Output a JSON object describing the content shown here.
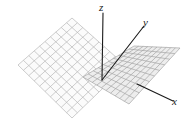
{
  "figure": {
    "name": "two-intersecting-planes-3d-axes",
    "background_color": "#ffffff",
    "axes": [
      {
        "id": "z",
        "label": "z",
        "icon": "axis-arrow-icon",
        "direction": "vertical-up",
        "from": [
          102,
          80
        ],
        "to": [
          103,
          13
        ],
        "color": "#1a1a1a"
      },
      {
        "id": "y",
        "label": "y",
        "icon": "axis-arrow-icon",
        "direction": "upper-right",
        "from": [
          102,
          80
        ],
        "to": [
          144,
          26
        ],
        "color": "#1a1a1a"
      },
      {
        "id": "x",
        "label": "x",
        "icon": "axis-arrow-icon",
        "direction": "lower-right",
        "from": [
          137,
          84
        ],
        "to": [
          173,
          101
        ],
        "color": "#1a1a1a"
      }
    ],
    "planes": [
      {
        "id": "left-plane",
        "name": "left-grid-plane",
        "fill_color": "#fbfbfb",
        "grid_line_color": "#b8b8b8",
        "grid_cols": 10,
        "grid_rows": 10,
        "corners": [
          [
            18,
            65
          ],
          [
            72,
            18
          ],
          [
            126,
            66
          ],
          [
            72,
            118
          ]
        ]
      },
      {
        "id": "right-plane",
        "name": "right-grid-plane",
        "fill_color": "#ededed",
        "grid_line_color": "#a5a5a5",
        "grid_cols": 10,
        "grid_rows": 10,
        "corners": [
          [
            83,
            77
          ],
          [
            134,
            46
          ],
          [
            180,
            48
          ],
          [
            129,
            104
          ]
        ]
      }
    ]
  }
}
